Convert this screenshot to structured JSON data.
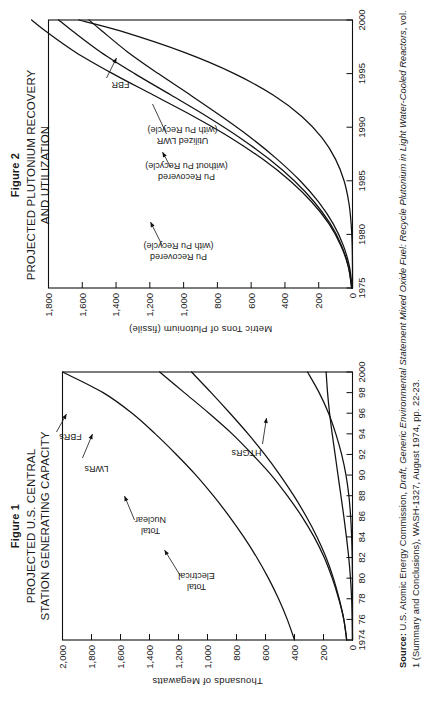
{
  "page": {
    "orientation": "rotated-90-ccw",
    "background": "#ffffff",
    "ink": "#1a1a1a"
  },
  "source": {
    "label": "Source:",
    "text_part1": " U.S. Atomic Energy Commission, ",
    "italic1": "Draft, Generic Environmental Statement Mixed Oxide Fuel: Recycle Plutonium in Light Water-Cooled Reactors",
    "text_part2": ", vol. 1 (Summary and Conclusions), WASH-1327, August 1974, pp. 22-23."
  },
  "figure1": {
    "label": "Figure 1",
    "title_line1": "PROJECTED U.S. CENTRAL",
    "title_line2": "STATION GENERATING CAPACITY"
  },
  "figure2": {
    "label": "Figure 2",
    "title_line1": "PROJECTED PLUTONIUM RECOVERY",
    "title_line2": "AND UTILIZATION"
  },
  "chart_data": [
    {
      "id": "figure1",
      "type": "line",
      "title": "PROJECTED U.S. CENTRAL STATION GENERATING CAPACITY",
      "xlabel": "",
      "ylabel": "Thousands of Megawatts",
      "xlim": [
        1974,
        2000
      ],
      "ylim": [
        0,
        2000
      ],
      "grid": false,
      "legend": "inline-annotations",
      "xticks": [
        1974,
        1976,
        1978,
        1980,
        1982,
        1984,
        1986,
        1988,
        1990,
        1992,
        1994,
        1996,
        1998,
        2000
      ],
      "xticklabels": [
        "1974",
        "76",
        "78",
        "80",
        "82",
        "84",
        "86",
        "88",
        "90",
        "92",
        "94",
        "96",
        "98",
        "2000"
      ],
      "yticks": [
        0,
        200,
        400,
        600,
        800,
        1000,
        1200,
        1400,
        1600,
        1800,
        2000
      ],
      "yticklabels": [
        "0",
        "200",
        "400",
        "600",
        "800",
        "1,000",
        "1,200",
        "1,400",
        "1,600",
        "1,800",
        "2,000"
      ],
      "x": [
        1974,
        1976,
        1978,
        1980,
        1982,
        1984,
        1986,
        1988,
        1990,
        1992,
        1994,
        1996,
        1998,
        2000
      ],
      "series": [
        {
          "name": "Total Electrical",
          "label": "Total\nElectrical",
          "label_line1": "Total",
          "label_line2": "Electrical",
          "values": [
            400,
            450,
            510,
            580,
            660,
            750,
            850,
            960,
            1080,
            1215,
            1360,
            1520,
            1720,
            2000
          ]
        },
        {
          "name": "Total Nuclear",
          "label_line1": "Total",
          "label_line2": "Nuclear",
          "values": [
            40,
            60,
            95,
            140,
            195,
            265,
            350,
            450,
            560,
            690,
            830,
            990,
            1160,
            1330
          ]
        },
        {
          "name": "LWRs",
          "label_line1": "LWRs",
          "label_line2": "",
          "values": [
            40,
            60,
            92,
            132,
            182,
            245,
            320,
            405,
            500,
            605,
            720,
            845,
            975,
            1110
          ]
        },
        {
          "name": "HTGRs",
          "label_line1": "HTGRs",
          "label_line2": "",
          "values": [
            0,
            2,
            6,
            14,
            26,
            42,
            60,
            80,
            100,
            120,
            140,
            158,
            172,
            182
          ]
        },
        {
          "name": "FBRs",
          "label_line1": "FBRs",
          "label_line2": "",
          "values": [
            0,
            0,
            0,
            0,
            2,
            6,
            13,
            25,
            45,
            75,
            115,
            165,
            230,
            310
          ]
        }
      ]
    },
    {
      "id": "figure2",
      "type": "line",
      "title": "PROJECTED PLUTONIUM RECOVERY AND UTILIZATION",
      "xlabel": "",
      "ylabel": "Metric Tons of Plutonium (fissile)",
      "xlim": [
        1975,
        2000
      ],
      "ylim": [
        0,
        1800
      ],
      "grid": false,
      "legend": "inline-annotations",
      "xticks": [
        1975,
        1980,
        1985,
        1990,
        1995,
        2000
      ],
      "xticklabels": [
        "1975",
        "1980",
        "1985",
        "1990",
        "1995",
        "2000"
      ],
      "yticks": [
        0,
        200,
        400,
        600,
        800,
        1000,
        1200,
        1400,
        1600,
        1800
      ],
      "yticklabels": [
        "0",
        "200",
        "400",
        "600",
        "800",
        "1,000",
        "1,200",
        "1,400",
        "1,600",
        "1,800"
      ],
      "x": [
        1975,
        1977,
        1979,
        1981,
        1983,
        1985,
        1987,
        1989,
        1991,
        1993,
        1995,
        1997,
        1999,
        2000
      ],
      "series": [
        {
          "name": "Pu Recovered (with Pu Recycle)",
          "label_line1": "Pu Recovered",
          "label_line2": "(with Pu Recycle)",
          "values": [
            5,
            25,
            70,
            140,
            240,
            370,
            530,
            720,
            940,
            1180,
            1420,
            1640,
            1820,
            1900
          ]
        },
        {
          "name": "Pu Recovered (without Pu Recycle)",
          "label_line1": "Pu Recovered",
          "label_line2": "(without Pu Recycle)",
          "values": [
            5,
            24,
            66,
            132,
            225,
            345,
            492,
            665,
            862,
            1075,
            1290,
            1490,
            1660,
            1740
          ]
        },
        {
          "name": "Utilized LWR (with Pu Recycle)",
          "label_line1": "Utilized LWR",
          "label_line2": "(with Pu Recycle)",
          "values": [
            2,
            18,
            55,
            115,
            200,
            310,
            445,
            600,
            775,
            960,
            1150,
            1330,
            1485,
            1560
          ]
        },
        {
          "name": "FBR",
          "label_line1": "FBR",
          "label_line2": "",
          "values": [
            0,
            0,
            2,
            8,
            22,
            50,
            100,
            180,
            300,
            470,
            700,
            1000,
            1380,
            1620
          ]
        }
      ]
    }
  ]
}
